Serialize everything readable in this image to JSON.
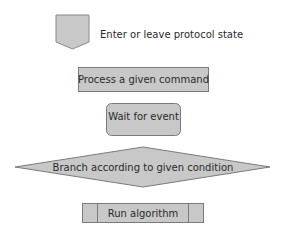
{
  "legend": {
    "items": [
      {
        "shape": "pentagon-down",
        "label": "Enter or leave protocol state"
      },
      {
        "shape": "rectangle",
        "label": "Process a given command"
      },
      {
        "shape": "rounded-rectangle",
        "label": "Wait for event"
      },
      {
        "shape": "diamond",
        "label": "Branch according to given condition"
      },
      {
        "shape": "predefined-process",
        "label": "Run algorithm"
      }
    ]
  },
  "colors": {
    "fill": "#c8c8c8",
    "stroke": "#7a7a7a",
    "text": "#2a2a2a",
    "background": "#ffffff"
  }
}
